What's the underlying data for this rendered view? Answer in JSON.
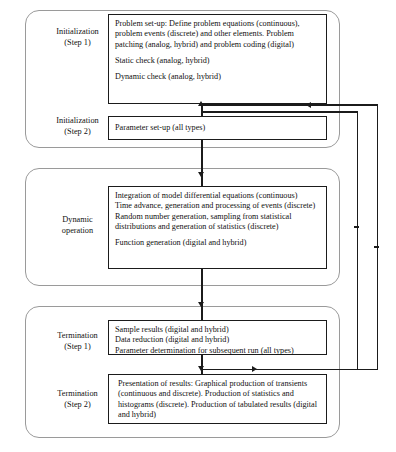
{
  "diagram": {
    "colors": {
      "box_border": "#1b1b1b",
      "container_border": "#9a9a9a",
      "background": "#ffffff",
      "text": "#111111"
    },
    "phases": [
      {
        "id": "initialization",
        "steps": [
          {
            "label_line1": "Initialization",
            "label_line2": "(Step 1)",
            "paragraphs": [
              "Problem set-up: Define problem equations (continuous), problem events (discrete) and other elements. Problem patching (analog, hybrid) and problem coding (digital)",
              "Static check (analog, hybrid)",
              "Dynamic check (analog, hybrid)"
            ]
          },
          {
            "label_line1": "Initialization",
            "label_line2": "(Step 2)",
            "paragraphs": [
              "Parameter set-up (all types)"
            ]
          }
        ]
      },
      {
        "id": "dynamic-operation",
        "steps": [
          {
            "label_line1": "Dynamic",
            "label_line2": "operation",
            "paragraphs": [
              "Integration of model differential equations (continuous)",
              "Time advance, generation and processing of events (discrete)",
              "Random number generation, sampling from statistical distributions and generation of statistics (discrete)",
              "Function generation (digital and hybrid)"
            ]
          }
        ]
      },
      {
        "id": "termination",
        "steps": [
          {
            "label_line1": "Termination",
            "label_line2": "(Step 1)",
            "paragraphs": [
              "Sample results (digital and hybrid)",
              "Data reduction (digital and hybrid)",
              "Parameter determination for subsequent run (all types)"
            ]
          },
          {
            "label_line1": "Termination",
            "label_line2": "(Step 2)",
            "paragraphs": [
              "Presentation of results: Graphical production of transients (continuous and discrete). Production of statistics and histograms (discrete). Production of tabulated results (digital and hybrid)"
            ]
          }
        ]
      }
    ],
    "connectors": [
      {
        "name": "init-step1-to-step2",
        "direction": "down"
      },
      {
        "name": "init-step2-to-dynamic",
        "direction": "down"
      },
      {
        "name": "dynamic-to-termination-step1",
        "direction": "down"
      },
      {
        "name": "termination-step1-to-step2",
        "direction": "down"
      },
      {
        "name": "feedback-inner-to-initialization",
        "direction": "left"
      },
      {
        "name": "feedback-outer-to-initialization",
        "direction": "left"
      }
    ]
  }
}
